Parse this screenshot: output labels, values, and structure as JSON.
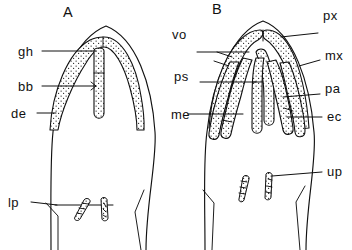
{
  "figure": {
    "kind": "anatomical-line-drawing",
    "background_color": "#ffffff",
    "ink_color": "#111111",
    "panels": [
      {
        "id": "A",
        "letter": "A",
        "labels": [
          "gh",
          "bb",
          "de",
          "lp"
        ]
      },
      {
        "id": "B",
        "letter": "B",
        "labels": [
          "px",
          "vo",
          "mx",
          "ps",
          "pa",
          "me",
          "ec",
          "up"
        ]
      }
    ]
  },
  "panel_a": {
    "letter": "A",
    "label_gh": "gh",
    "label_bb": "bb",
    "label_de": "de",
    "label_lp": "lp"
  },
  "panel_b": {
    "letter": "B",
    "label_px": "px",
    "label_vo": "vo",
    "label_mx": "mx",
    "label_ps": "ps",
    "label_pa": "pa",
    "label_me": "me",
    "label_ec": "ec",
    "label_up": "up"
  }
}
